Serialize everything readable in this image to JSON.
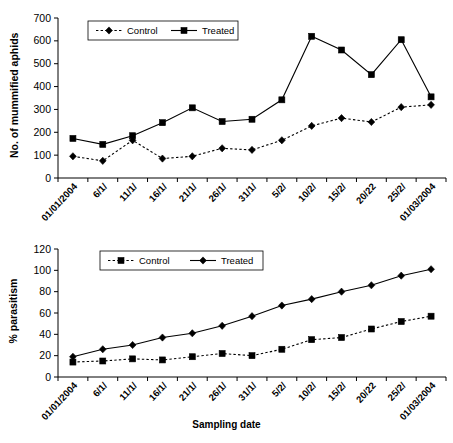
{
  "figure": {
    "background": "#ffffff",
    "ink": "#000000"
  },
  "chart_data": [
    {
      "type": "line",
      "title": "",
      "xlabel": "",
      "ylabel": "No. of mummified aphids",
      "ylim": [
        0,
        700
      ],
      "yticks": [
        0,
        100,
        200,
        300,
        400,
        500,
        600,
        700
      ],
      "grid": false,
      "legend_position": "top-center",
      "categories": [
        "01/01/2004",
        "6/1/",
        "11/1/",
        "16/1/",
        "21/1/",
        "26/1/",
        "31/1/",
        "5/2/",
        "10/2/",
        "15/2/",
        "20/22",
        "25/2/",
        "01/03/2004"
      ],
      "series": [
        {
          "name": "Control",
          "marker": "diamond",
          "linestyle": "dotted",
          "color": "#000000",
          "values": [
            95,
            75,
            165,
            85,
            95,
            130,
            123,
            165,
            228,
            262,
            245,
            310,
            320
          ]
        },
        {
          "name": "Treated",
          "marker": "square",
          "linestyle": "solid",
          "color": "#000000",
          "values": [
            173,
            147,
            185,
            242,
            307,
            247,
            257,
            342,
            620,
            560,
            452,
            605,
            355
          ]
        }
      ]
    },
    {
      "type": "line",
      "title": "",
      "xlabel": "Sampling date",
      "ylabel": "% parasitism",
      "ylim": [
        0,
        120
      ],
      "yticks": [
        0,
        20,
        40,
        60,
        80,
        100,
        120
      ],
      "grid": false,
      "legend_position": "top-center",
      "categories": [
        "01/01/2004",
        "6/1/",
        "11/1/",
        "16/1/",
        "21/1/",
        "26/1/",
        "31/1/",
        "5/2/",
        "10/2/",
        "15/2/",
        "20/22",
        "25/2/",
        "01/03/2004"
      ],
      "series": [
        {
          "name": "Control",
          "marker": "square",
          "linestyle": "dotted",
          "color": "#000000",
          "values": [
            14,
            15,
            17,
            16,
            19,
            22,
            20,
            26,
            35,
            37,
            45,
            52,
            57
          ]
        },
        {
          "name": "Treated",
          "marker": "diamond",
          "linestyle": "solid",
          "color": "#000000",
          "values": [
            19,
            26,
            30,
            37,
            41,
            48,
            57,
            67,
            73,
            80,
            86,
            95,
            101
          ]
        }
      ]
    }
  ]
}
